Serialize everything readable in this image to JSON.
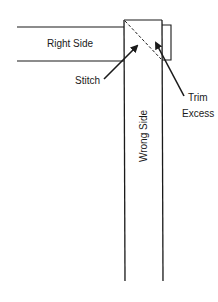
{
  "diagram": {
    "labels": {
      "right_side": "Right Side",
      "wrong_side": "Wrong Side",
      "stitch": "Stitch",
      "trim": "Trim",
      "excess": "Excess"
    },
    "colors": {
      "line": "#1a1a1a",
      "background": "#ffffff"
    }
  }
}
